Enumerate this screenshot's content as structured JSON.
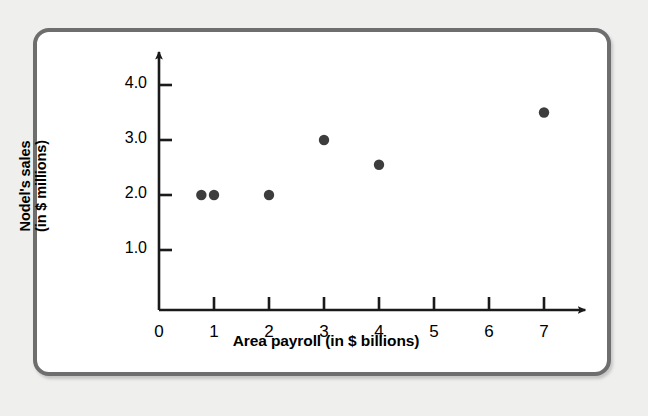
{
  "chart_data": {
    "type": "scatter",
    "title": "",
    "xlabel": "Area payroll (in $ billions)",
    "ylabel": "Nodel's sales (in $ millions)",
    "ylabel_line1": "Nodel's sales",
    "ylabel_line2": "(in $ millions)",
    "xlim": [
      0,
      7.6
    ],
    "ylim": [
      0,
      4.6
    ],
    "xticks": [
      0,
      1,
      2,
      3,
      4,
      5,
      6,
      7
    ],
    "xtick_labels": [
      "0",
      "1",
      "2",
      "3",
      "4",
      "5",
      "6",
      "7"
    ],
    "yticks": [
      1.0,
      2.0,
      3.0,
      4.0
    ],
    "ytick_labels": [
      "1.0",
      "2.0",
      "3.0",
      "4.0"
    ],
    "grid": false,
    "legend": "none",
    "marker_color": "#3d3d3d",
    "axis_color": "#1a1a1a",
    "points": [
      {
        "x": 0.77,
        "y": 2.0
      },
      {
        "x": 1.0,
        "y": 2.0
      },
      {
        "x": 2.0,
        "y": 2.0
      },
      {
        "x": 3.0,
        "y": 3.0
      },
      {
        "x": 4.0,
        "y": 2.55
      },
      {
        "x": 7.0,
        "y": 3.5
      }
    ]
  },
  "figure": {
    "card_background": "#ffffff",
    "page_background": "#efefee",
    "border_color": "#6e6e6e"
  }
}
